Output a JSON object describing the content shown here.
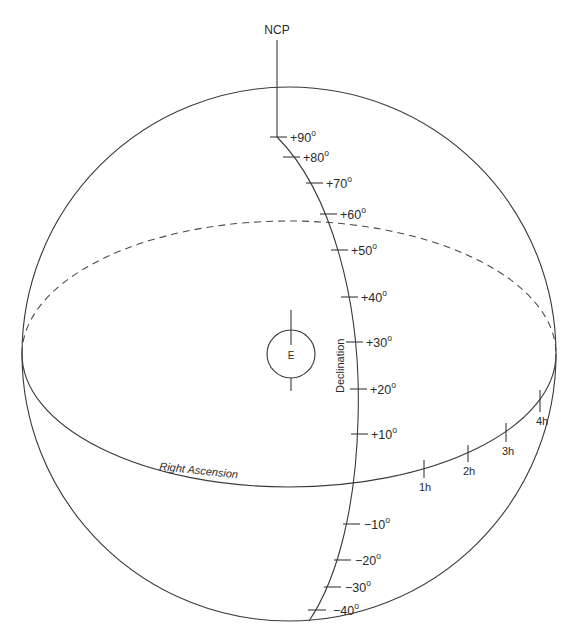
{
  "title_label": "NCP",
  "earth_label": "E",
  "declination_axis_label": "Declination",
  "right_ascension_axis_label": "Right Ascension",
  "colors": {
    "stroke": "#3a3a3a",
    "text": "#2a2a2a",
    "background": "#ffffff"
  },
  "declination_ticks": [
    {
      "value": "+90",
      "degree": "o"
    },
    {
      "value": "+80",
      "degree": "o"
    },
    {
      "value": "+70",
      "degree": "o"
    },
    {
      "value": "+60",
      "degree": "o"
    },
    {
      "value": "+50",
      "degree": "o"
    },
    {
      "value": "+40",
      "degree": "o"
    },
    {
      "value": "+30",
      "degree": "o"
    },
    {
      "value": "+20",
      "degree": "o"
    },
    {
      "value": "+10",
      "degree": "o"
    },
    {
      "value": "−10",
      "degree": "o"
    },
    {
      "value": "−20",
      "degree": "o"
    },
    {
      "value": "−30",
      "degree": "o"
    },
    {
      "value": "−40",
      "degree": "o"
    }
  ],
  "right_ascension_ticks": [
    {
      "value": "1h"
    },
    {
      "value": "2h"
    },
    {
      "value": "3h"
    },
    {
      "value": "4h"
    }
  ]
}
